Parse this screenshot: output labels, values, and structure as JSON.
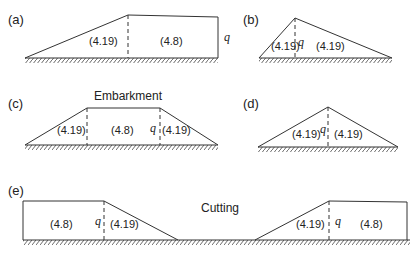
{
  "figure": {
    "panels": [
      {
        "id": "a",
        "label": "(a)",
        "regions": [
          "(4.19)",
          "(4.8)"
        ],
        "q_label": "q",
        "description": "Half embankment: sloped region then flat vertical-edged region"
      },
      {
        "id": "b",
        "label": "(b)",
        "regions": [
          "(4.19)",
          "(4.19)"
        ],
        "q_label": "q",
        "description": "Asymmetric triangular embankment"
      },
      {
        "id": "c",
        "label": "(c)",
        "title": "Embarkment",
        "regions": [
          "(4.19)",
          "(4.8)",
          "(4.19)"
        ],
        "q_label": "q",
        "description": "Trapezoidal embankment"
      },
      {
        "id": "d",
        "label": "(d)",
        "regions": [
          "(4.19)",
          "(4.19)"
        ],
        "q_label": "q",
        "description": "Symmetric triangular embankment"
      },
      {
        "id": "e",
        "label": "(e)",
        "title": "Cutting",
        "regions": [
          "(4.8)",
          "(4.19)",
          "(4.19)",
          "(4.8)"
        ],
        "q_labels": [
          "q",
          "q"
        ],
        "description": "Cutting with slopes on both sides"
      }
    ],
    "colors": {
      "line": "#333333",
      "text": "#222222",
      "background": "#ffffff"
    }
  }
}
